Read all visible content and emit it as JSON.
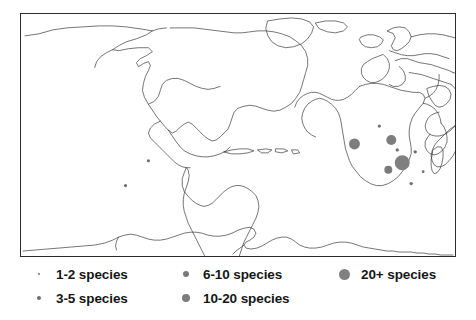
{
  "figure": {
    "name": "world-species-distribution-map",
    "background_color": "#ffffff",
    "frame_color": "#2b2b2b",
    "coastline_color": "#3a3a3a"
  },
  "legend": {
    "marker_color": "#808080",
    "columns": [
      {
        "entries": [
          {
            "label": "1-2 species",
            "marker_diameter": 2,
            "color": "#707070"
          },
          {
            "label": "3-5 species",
            "marker_diameter": 4,
            "color": "#6e6e6e"
          }
        ]
      },
      {
        "entries": [
          {
            "label": "6-10 species",
            "marker_diameter": 6,
            "color": "#7a7a7a"
          },
          {
            "label": "10-20 species",
            "marker_diameter": 8,
            "color": "#7d7d7d"
          }
        ]
      },
      {
        "entries": [
          {
            "label": "20+ species",
            "marker_diameter": 11,
            "color": "#808080"
          }
        ]
      }
    ]
  },
  "chart_data": {
    "type": "scatter",
    "title": "",
    "xlabel": "",
    "ylabel": "",
    "projection": "equirectangular-world-outline",
    "plot_box_px": {
      "x": 20,
      "y": 13,
      "width": 436,
      "height": 244
    },
    "size_legend": [
      {
        "class": "1-2 species",
        "diameter_px": 2
      },
      {
        "class": "3-5 species",
        "diameter_px": 4
      },
      {
        "class": "6-10 species",
        "diameter_px": 6
      },
      {
        "class": "10-20 species",
        "diameter_px": 8
      },
      {
        "class": "20+ species",
        "diameter_px": 11
      }
    ],
    "points": [
      {
        "region": "Amazonia (Brazil)",
        "cx": 148,
        "cy": 161,
        "r": 1.6,
        "class": "1-2 species",
        "color": "#6f6f6f"
      },
      {
        "region": "Southern Andes (Chile/Argentina)",
        "cx": 125,
        "cy": 186,
        "r": 1.6,
        "class": "1-2 species",
        "color": "#6f6f6f"
      },
      {
        "region": "Indonesia / Java",
        "cx": 355,
        "cy": 144,
        "r": 5.5,
        "class": "10-20 species",
        "color": "#7d7d7d"
      },
      {
        "region": "New Guinea",
        "cx": 392,
        "cy": 140,
        "r": 5.0,
        "class": "10-20 species",
        "color": "#7d7d7d"
      },
      {
        "region": "Philippines",
        "cx": 380,
        "cy": 126,
        "r": 1.6,
        "class": "1-2 species",
        "color": "#6f6f6f"
      },
      {
        "region": "Micronesia",
        "cx": 398,
        "cy": 150,
        "r": 1.7,
        "class": "1-2 species",
        "color": "#6f6f6f"
      },
      {
        "region": "Solomon Islands",
        "cx": 416,
        "cy": 152,
        "r": 1.7,
        "class": "1-2 species",
        "color": "#6f6f6f"
      },
      {
        "region": "New Caledonia / Vanuatu",
        "cx": 403,
        "cy": 163,
        "r": 7.5,
        "class": "20+ species",
        "color": "#808080"
      },
      {
        "region": "Eastern Australia (Queensland)",
        "cx": 389,
        "cy": 170,
        "r": 4.0,
        "class": "6-10 species",
        "color": "#7a7a7a"
      },
      {
        "region": "New Zealand North",
        "cx": 412,
        "cy": 184,
        "r": 1.7,
        "class": "1-2 species",
        "color": "#6f6f6f"
      },
      {
        "region": "South Pacific",
        "cx": 424,
        "cy": 172,
        "r": 1.4,
        "class": "1-2 species",
        "color": "#6f6f6f"
      }
    ]
  }
}
